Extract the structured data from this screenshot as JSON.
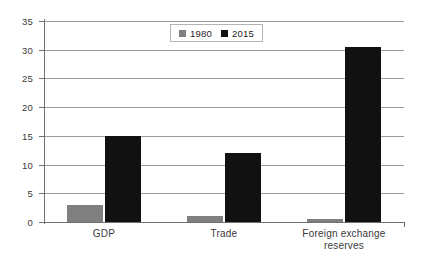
{
  "chart_data": {
    "type": "bar",
    "title": "",
    "xlabel": "",
    "ylabel": "",
    "categories": [
      "GDP",
      "Trade",
      "Foreign exchange reserves"
    ],
    "category_lines": [
      [
        "GDP"
      ],
      [
        "Trade"
      ],
      [
        "Foreign exchange",
        "reserves"
      ]
    ],
    "series": [
      {
        "name": "1980",
        "color": "#808080",
        "values": [
          3,
          1,
          0.6
        ]
      },
      {
        "name": "2015",
        "color": "#111111",
        "values": [
          15,
          12,
          30.5
        ]
      }
    ],
    "ylim": [
      0,
      35
    ],
    "yticks": [
      0,
      5,
      10,
      15,
      20,
      25,
      30,
      35
    ],
    "ytick_labels": [
      "0",
      "5",
      "10",
      "15",
      "20",
      "25",
      "30",
      "35"
    ],
    "grid": true,
    "legend_position": "top-center",
    "legend_entries": [
      {
        "label": "1980",
        "color": "#808080"
      },
      {
        "label": "2015",
        "color": "#111111"
      }
    ]
  },
  "colors": {
    "background": "#ffffff",
    "axis": "#6f6f6f",
    "gridline": "#9a9a9a",
    "text": "#3a3a3a",
    "legend_border": "#b4b4b4"
  }
}
